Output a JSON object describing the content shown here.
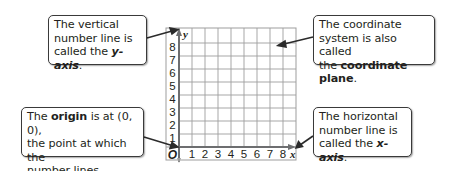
{
  "callouts": {
    "y_axis": {
      "line1": "The vertical",
      "line2": "number line is",
      "line3_pre": "called the ",
      "line3_term": "y-axis",
      "line3_post": "."
    },
    "origin": {
      "line1_pre": "The ",
      "line1_term": "origin",
      "line1_post": " is at (0, 0),",
      "line2": "the point at which the",
      "line3": "number lines intersect."
    },
    "plane": {
      "line1": "The coordinate",
      "line2": "system is also called",
      "line3_pre": "the ",
      "line3_term": "coordinate plane",
      "line3_post": "."
    },
    "x_axis": {
      "line1": "The horizontal",
      "line2": "number line is",
      "line3_pre": "called the ",
      "line3_term": "x-axis",
      "line3_post": "."
    }
  },
  "grid": {
    "x_label": "x",
    "y_label": "y",
    "origin_label": "O",
    "x_ticks": [
      "1",
      "2",
      "3",
      "4",
      "5",
      "6",
      "7",
      "8"
    ],
    "y_ticks": [
      "1",
      "2",
      "3",
      "4",
      "5",
      "6",
      "7",
      "8"
    ],
    "grid_color": "#9d9d9d",
    "axis_color": "#6d6e70",
    "arrow_color": "#2b2b2b"
  }
}
